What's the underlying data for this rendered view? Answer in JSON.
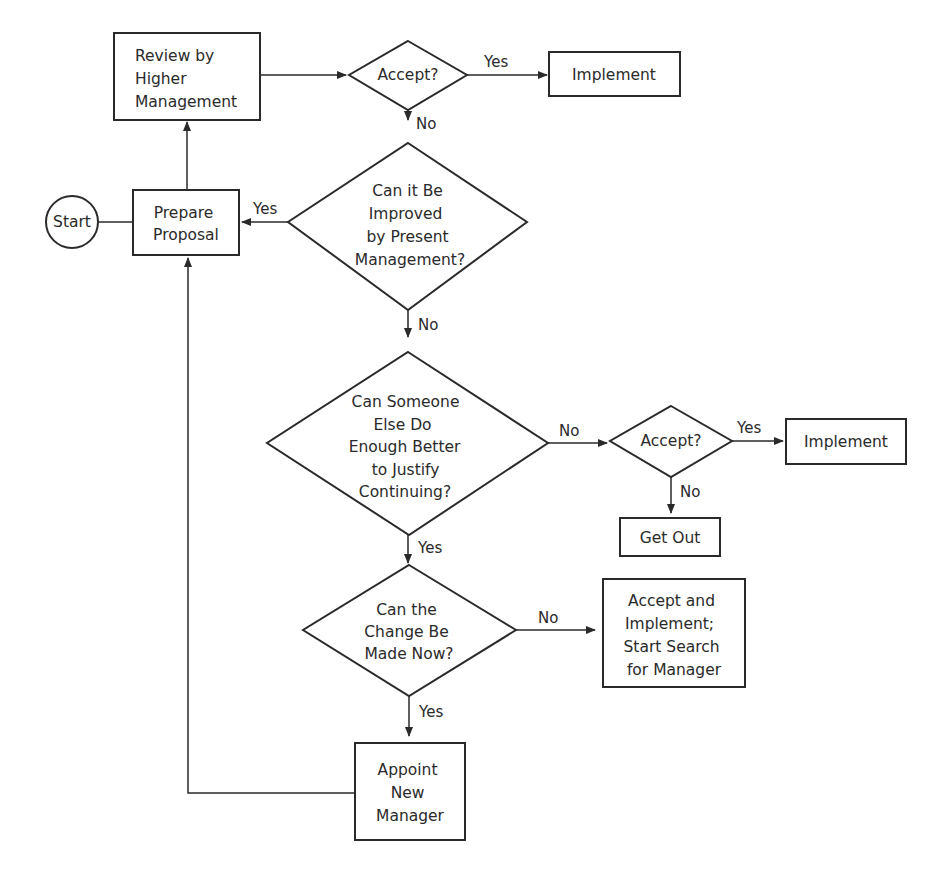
{
  "diagram": {
    "type": "flowchart",
    "nodes": {
      "start": {
        "label": "Start",
        "shape": "circle"
      },
      "review": {
        "label_lines": [
          "Review by",
          "Higher",
          "Management"
        ],
        "shape": "rect"
      },
      "accept1": {
        "label": "Accept?",
        "shape": "diamond"
      },
      "implement1": {
        "label": "Implement",
        "shape": "rect"
      },
      "prepare": {
        "label_lines": [
          "Prepare",
          "Proposal"
        ],
        "shape": "rect"
      },
      "improve": {
        "label_lines": [
          "Can it Be",
          "Improved",
          "by Present",
          "Management?"
        ],
        "shape": "diamond"
      },
      "someone_else": {
        "label_lines": [
          "Can Someone",
          "Else Do",
          "Enough Better",
          "to Justify",
          "Continuing?"
        ],
        "shape": "diamond"
      },
      "accept2": {
        "label": "Accept?",
        "shape": "diamond"
      },
      "implement2": {
        "label": "Implement",
        "shape": "rect"
      },
      "get_out": {
        "label": "Get Out",
        "shape": "rect"
      },
      "change_now": {
        "label_lines": [
          "Can the",
          "Change Be",
          "Made Now?"
        ],
        "shape": "diamond"
      },
      "accept_search": {
        "label_lines": [
          "Accept and",
          "Implement;",
          "Start Search",
          "for Manager"
        ],
        "shape": "rect"
      },
      "appoint": {
        "label_lines": [
          "Appoint",
          "New",
          "Manager"
        ],
        "shape": "rect"
      }
    },
    "edges": {
      "accept1_yes": "Yes",
      "accept1_no": "No",
      "improve_yes": "Yes",
      "improve_no": "No",
      "someone_else_no": "No",
      "someone_else_yes": "Yes",
      "accept2_yes": "Yes",
      "accept2_no": "No",
      "change_now_no": "No",
      "change_now_yes": "Yes"
    },
    "colors": {
      "line": "#2a2a2a",
      "background": "#ffffff"
    }
  }
}
